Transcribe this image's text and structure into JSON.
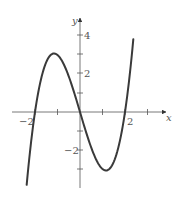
{
  "chart_data": {
    "type": "line",
    "title": "",
    "xlabel": "x",
    "ylabel": "y",
    "function": "x^3 - 4x",
    "xlim": [
      -2.4,
      2.4
    ],
    "ylim": [
      -4,
      4.5
    ],
    "x_ticks": [
      -2,
      -1,
      1,
      2,
      3
    ],
    "y_ticks": [
      -3,
      -2,
      -1,
      1,
      2,
      3,
      4
    ],
    "x_tick_labels": [
      {
        "value": -2,
        "label": "−2"
      },
      {
        "value": 2,
        "label": "2"
      }
    ],
    "y_tick_labels": [
      {
        "value": 4,
        "label": "4"
      },
      {
        "value": 2,
        "label": "2"
      },
      {
        "value": -2,
        "label": "−2"
      }
    ],
    "grid": false,
    "legend": null,
    "series": [
      {
        "name": "f(x)",
        "color": "#3a3a3a",
        "x": [
          -2.37,
          -2.2,
          -2,
          -1.8,
          -1.6,
          -1.4,
          -1.15,
          -1,
          -0.8,
          -0.6,
          -0.4,
          -0.2,
          0,
          0.2,
          0.4,
          0.6,
          0.8,
          1,
          1.15,
          1.4,
          1.6,
          1.8,
          2,
          2.2,
          2.37
        ],
        "values": [
          -3.83,
          -1.85,
          0,
          1.37,
          2.3,
          2.86,
          3.08,
          3.0,
          2.69,
          2.18,
          1.54,
          0.79,
          0,
          -0.79,
          -1.54,
          -2.18,
          -2.69,
          -3.0,
          -3.08,
          -2.86,
          -2.3,
          -1.37,
          0,
          1.85,
          3.83
        ]
      }
    ],
    "key_points": {
      "roots": [
        -2,
        0,
        2
      ],
      "local_max": [
        -1.15,
        3.08
      ],
      "local_min": [
        1.15,
        -3.08
      ]
    }
  },
  "labels": {
    "x_axis": "x",
    "y_axis": "y",
    "x_neg2": "−2",
    "x_pos2": "2",
    "y_pos4": "4",
    "y_pos2": "2",
    "y_neg2": "−2"
  },
  "style": {
    "curve_color": "#3a3a3a",
    "axis_color": "#555555"
  }
}
